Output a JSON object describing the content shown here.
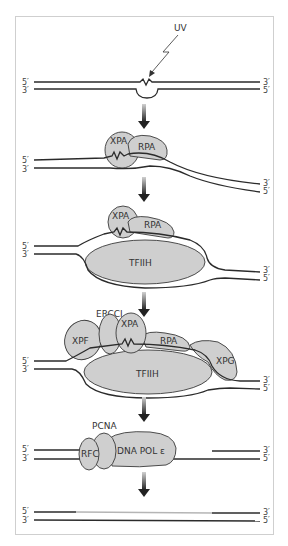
{
  "colors": {
    "protein_fill": "#cfcfcf",
    "strand": "#2b2b2b",
    "new_strand": "#b5b5b5",
    "frame_border": "#cfcfcf",
    "arrow": "#333333"
  },
  "strand_ends": {
    "top_left": "5′",
    "bottom_left": "3′",
    "top_right": "3′",
    "bottom_right": "5′"
  },
  "steps": [
    {
      "name": "damage",
      "labels": {
        "agent": "UV"
      }
    },
    {
      "name": "recognition",
      "labels": {
        "xpa": "XPA",
        "rpa": "RPA"
      }
    },
    {
      "name": "unwinding",
      "labels": {
        "xpa": "XPA",
        "rpa": "RPA",
        "tfiih": "TFIIH"
      }
    },
    {
      "name": "incision",
      "labels": {
        "ercc1": "ERCCI",
        "xpf": "XPF",
        "xpa": "XPA",
        "rpa": "RPA",
        "tfiih": "TFIIH",
        "xpg": "XPG"
      }
    },
    {
      "name": "synthesis",
      "labels": {
        "pcna": "PCNA",
        "rfc": "RFC",
        "pol": "DNA POL ε"
      }
    },
    {
      "name": "ligation",
      "labels": {}
    }
  ]
}
